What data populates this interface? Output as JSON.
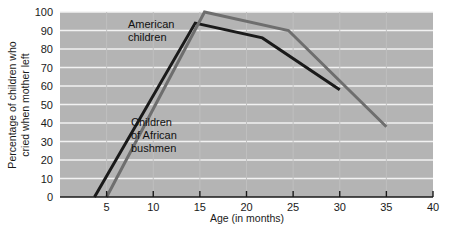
{
  "chart_data": {
    "type": "line",
    "title": "",
    "xlabel": "Age (in months)",
    "ylabel": "Percentage of children who cried when mother left",
    "xlim": [
      0,
      40
    ],
    "ylim": [
      0,
      100
    ],
    "xticks": [
      5,
      10,
      15,
      20,
      25,
      30,
      35,
      40
    ],
    "yticks": [
      0,
      10,
      20,
      30,
      40,
      50,
      60,
      70,
      80,
      90,
      100
    ],
    "grid": "horizontal",
    "legend_position": "inline-annotations",
    "plot_background": "#b4b4b4",
    "gridline_color": "#f2f2f2",
    "series": [
      {
        "name": "American children",
        "color": "#1a1a1a",
        "points": [
          {
            "x": 3.7,
            "y": 0
          },
          {
            "x": 14.5,
            "y": 94
          },
          {
            "x": 21.7,
            "y": 86
          },
          {
            "x": 30.0,
            "y": 58
          }
        ]
      },
      {
        "name": "Children of African bushmen",
        "color": "#6e6e6e",
        "points": [
          {
            "x": 5.0,
            "y": 0
          },
          {
            "x": 15.5,
            "y": 100
          },
          {
            "x": 24.5,
            "y": 90
          },
          {
            "x": 35.0,
            "y": 38
          }
        ]
      }
    ],
    "annotations": [
      {
        "name": "american-children-label",
        "lines": [
          "American",
          "children"
        ],
        "x_px": 128,
        "y_px": 28
      },
      {
        "name": "african-bushmen-label",
        "lines": [
          "Children",
          "of African",
          "bushmen"
        ],
        "x_px": 131,
        "y_px": 126
      }
    ]
  },
  "axis": {
    "y_tick_labels": [
      "100",
      "90",
      "80",
      "70",
      "60",
      "50",
      "40",
      "30",
      "20",
      "10",
      "0"
    ],
    "x_tick_labels": [
      "5",
      "10",
      "15",
      "20",
      "25",
      "30",
      "35",
      "40"
    ],
    "x_title": "Age (in months)",
    "y_title_line1": "Percentage of children who",
    "y_title_line2": "cried when mother left"
  }
}
